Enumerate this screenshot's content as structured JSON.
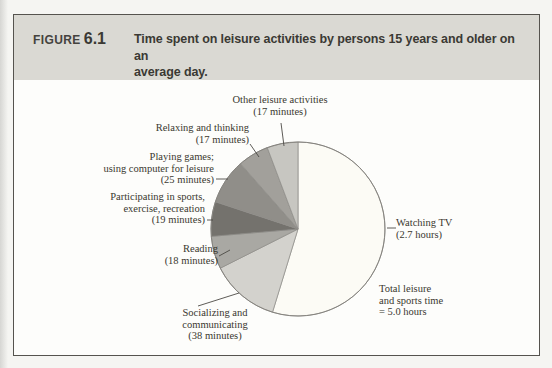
{
  "figure": {
    "label": "FIGURE",
    "number": "6.1",
    "title": "Time spent on leisure activities by persons 15 years and older on an\naverage day.",
    "header_bg": "#dad9d3",
    "border_color": "#55534e"
  },
  "chart_data": {
    "type": "pie",
    "title": "Time spent on leisure activities by persons 15 years and older on an average day",
    "unit": "minutes",
    "total_annotation": "Total leisure and sports time = 5.0 hours",
    "slices": [
      {
        "id": "watching-tv",
        "name": "Watching TV",
        "value_minutes": 162,
        "display_value": "2.7 hours",
        "color": "#fcfbf5"
      },
      {
        "id": "socializing",
        "name": "Socializing and communicating",
        "value_minutes": 38,
        "display_value": "38 minutes",
        "color": "#d3d2cd"
      },
      {
        "id": "reading",
        "name": "Reading",
        "value_minutes": 18,
        "display_value": "18 minutes",
        "color": "#a9a8a3"
      },
      {
        "id": "sports",
        "name": "Participating in sports, exercise, recreation",
        "value_minutes": 19,
        "display_value": "19 minutes",
        "color": "#74726d"
      },
      {
        "id": "playing-games",
        "name": "Playing games; using computer for leisure",
        "value_minutes": 25,
        "display_value": "25 minutes",
        "color": "#908e89"
      },
      {
        "id": "relaxing",
        "name": "Relaxing and thinking",
        "value_minutes": 17,
        "display_value": "17 minutes",
        "color": "#a2a09b"
      },
      {
        "id": "other",
        "name": "Other leisure activities",
        "value_minutes": 17,
        "display_value": "17 minutes",
        "color": "#c7c6c1"
      }
    ]
  },
  "labels": {
    "other": "Other leisure activities\n(17 minutes)",
    "relaxing": "Relaxing and thinking\n(17 minutes)",
    "playing": "Playing games;\nusing computer for leisure\n(25 minutes)",
    "participating": "Participating in sports,\nexercise, recreation\n(19 minutes)",
    "reading": "Reading\n(18 minutes)",
    "socializing": "Socializing and\ncommunicating\n(38 minutes)",
    "watching": "Watching TV\n(2.7 hours)",
    "total": "Total leisure\nand sports time\n= 5.0 hours"
  }
}
